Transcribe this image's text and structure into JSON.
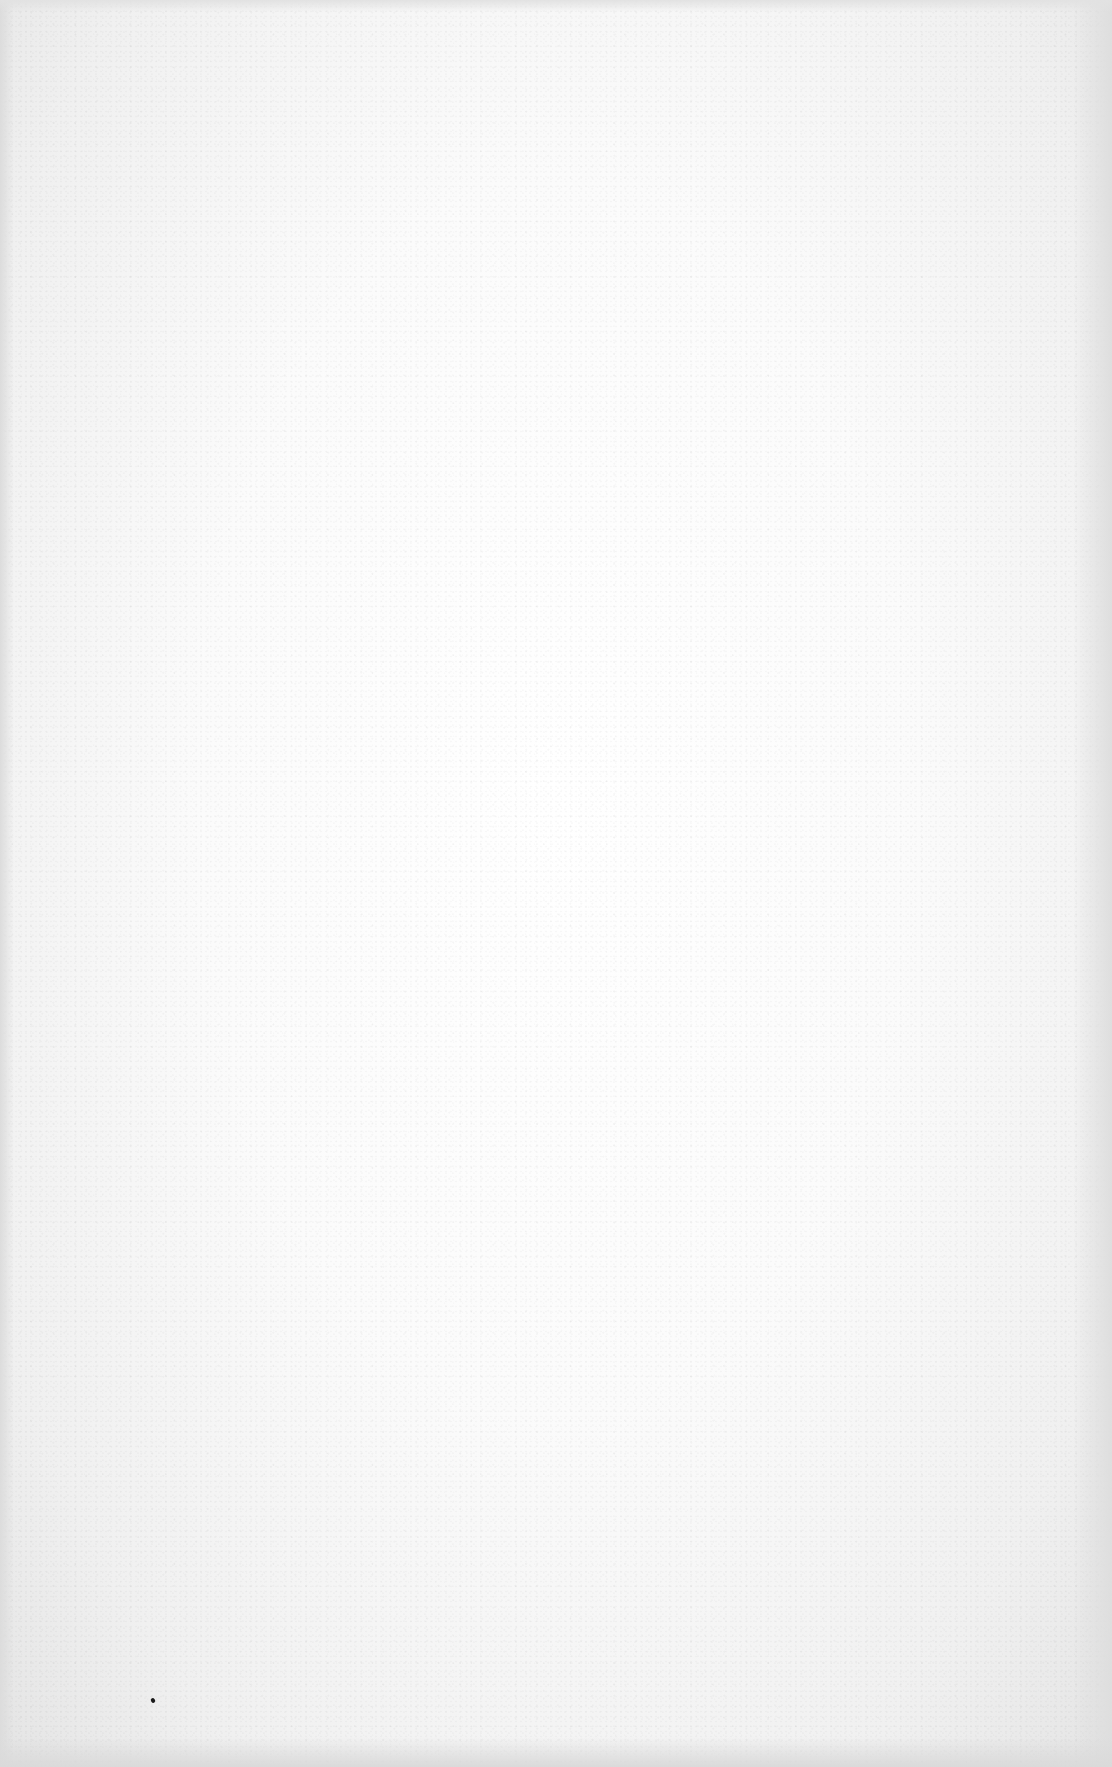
{
  "page": {
    "type": "scanned-blank-page",
    "paper_color": "#f7f7f7",
    "show_through_text": "",
    "show_through_note": "illegible mirrored bleed-through from reverse side",
    "speck_color": "#1a1a1a"
  }
}
